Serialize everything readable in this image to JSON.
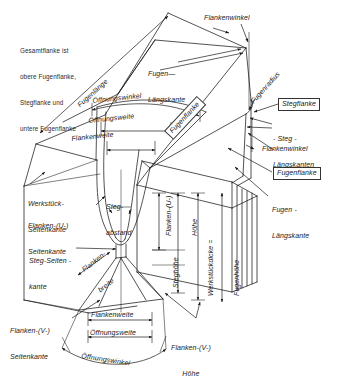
{
  "figure": {
    "language": "de",
    "line_color": "#1a1a1a",
    "text_color": "#1a1a1a",
    "background": "#ffffff"
  },
  "note": {
    "line1": "Gesamtflanke ist",
    "line2": "obere Fugenflanke,",
    "line3": "Stegflanke und",
    "line4": "untere Fugenflanke"
  },
  "labels": {
    "fugenlaenge": "Fugenlänge",
    "oeffnungswinkel_top": "Öffnungswinkel",
    "oeffnungsweite_top": "Öffnungsweite",
    "flankenweite_top": "Flankenweite",
    "fugen_langskante_top_1": "Fugen—",
    "fugen_langskante_top_2": "Längskante",
    "flankenwinkel_top": "Flankenwinkel",
    "fugenradius": "Fugenradius",
    "fugenflanke_rot": "Fugenflanke",
    "stegflanke_box": "Stegflanke",
    "steg_langskanten_1": "- Steg -",
    "steg_langskanten_2": "Längskanten",
    "flankenwinkel_right": "Flankenwinkel",
    "fugenflanke_box": "Fugenflanke",
    "fugen_langskante_right_1": "Fugen -",
    "fugen_langskante_right_2": "Längskante",
    "werkstueck_seitenkante_1": "Werkstück-",
    "werkstueck_seitenkante_2": "Seitenkante",
    "flanken_u_seitenkante_1": "Flanken-(U-)",
    "flanken_u_seitenkante_2": "Seitenkante",
    "steg_seitenkante_1": "Steg-Seiten -",
    "steg_seitenkante_2": "kante",
    "flanken_v_seitenkante_1": "Flanken-(V-)",
    "flanken_v_seitenkante_2": "Seitenkante",
    "stegabstand_1": "Steg-",
    "stegabstand_2": "abstand",
    "flankenbreite_1": "Flanken-",
    "flankenbreite_2": "breite",
    "flanken_u_hoehe_1": "Flanken-(U-)",
    "flanken_u_hoehe_2": "Höhe",
    "steghoehe": "Steghöhe",
    "werkstueckdicke_1": "Werkstückdicke =",
    "werkstueckdicke_2": "Fugenhöhe",
    "flankenweite_bottom": "Flankenweite",
    "oeffnungsweite_bottom": "Öffnungsweite",
    "oeffnungswinkel_bottom": "Öffnungswinkel",
    "flanken_v_hoehe_1": "Flanken-(V-)",
    "flanken_v_hoehe_2": "Höhe"
  }
}
